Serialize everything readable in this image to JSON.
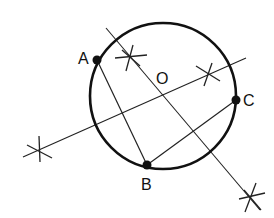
{
  "diagram": {
    "title": "",
    "circle": {
      "cx": 163,
      "cy": 96,
      "r": 73
    },
    "points": [
      {
        "id": "A",
        "label": "A",
        "x": 97,
        "y": 60,
        "lx": 78,
        "ly": 64
      },
      {
        "id": "B",
        "label": "B",
        "x": 147,
        "y": 165,
        "lx": 142,
        "ly": 190
      },
      {
        "id": "C",
        "label": "C",
        "x": 236,
        "y": 100,
        "lx": 243,
        "ly": 106
      },
      {
        "id": "O",
        "label": "O",
        "x": 162,
        "y": 96,
        "lx": 156,
        "ly": 84
      }
    ],
    "segments": [
      {
        "from": "A",
        "to": "B"
      },
      {
        "from": "B",
        "to": "C"
      }
    ],
    "bisectors": [
      {
        "name": "perpendicular-bisector-AB",
        "x1": 233,
        "y1": 49,
        "x2": 23,
        "y2": 157
      },
      {
        "name": "perpendicular-bisector-BC",
        "x1": 106,
        "y1": 28,
        "x2": 260,
        "y2": 210
      }
    ],
    "arc_marks": [
      {
        "x": 130,
        "y": 57
      },
      {
        "x": 209,
        "y": 73
      },
      {
        "x": 39,
        "y": 151
      },
      {
        "x": 251,
        "y": 199
      }
    ]
  }
}
